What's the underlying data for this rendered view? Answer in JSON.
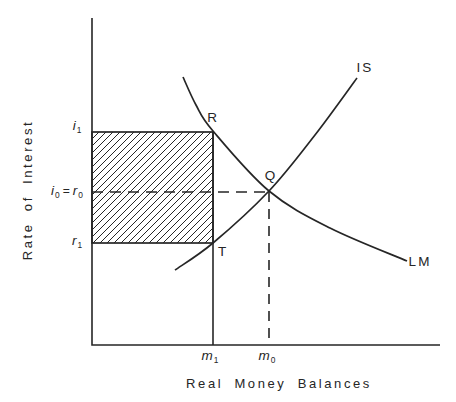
{
  "colors": {
    "ink": "#262626",
    "background": "#ffffff"
  },
  "axis": {
    "y_title": "Rate of Interest",
    "x_title": "Real Money Balances"
  },
  "labels": {
    "i1": {
      "base": "i",
      "sub": "1"
    },
    "i0r0": {
      "b1": "i",
      "s1": "0",
      "eq": "=",
      "b2": "r",
      "s2": "0"
    },
    "r1": {
      "base": "r",
      "sub": "1"
    },
    "m1": {
      "base": "m",
      "sub": "1"
    },
    "m0": {
      "base": "m",
      "sub": "0"
    }
  },
  "points": {
    "R": "R",
    "Q": "Q",
    "T": "T"
  },
  "curve_labels": {
    "is": "IS",
    "lm": "LM"
  },
  "geometry": {
    "axis": {
      "origin": [
        92,
        345
      ],
      "y_top": 18,
      "x_right": 440
    },
    "shaded_rect": {
      "x1": 92,
      "y1": 132,
      "x2": 213,
      "y2": 243
    },
    "solid_vline": {
      "x": 213,
      "y1": 132,
      "y2": 345
    },
    "dashed_h": {
      "y": 192,
      "x1": 92,
      "x2": 269
    },
    "dashed_v": {
      "x": 269,
      "y1": 192,
      "y2": 345
    },
    "hatch": {
      "spacing": 7,
      "direction": "forward-slash"
    },
    "curves": {
      "IS": [
        [
          175,
          270
        ],
        [
          213,
          243
        ],
        [
          269,
          191
        ],
        [
          315,
          135
        ],
        [
          357,
          78
        ]
      ],
      "LM": [
        [
          183,
          77
        ],
        [
          196,
          105
        ],
        [
          213,
          131
        ],
        [
          269,
          191
        ],
        [
          330,
          228
        ],
        [
          407,
          261
        ]
      ]
    }
  }
}
